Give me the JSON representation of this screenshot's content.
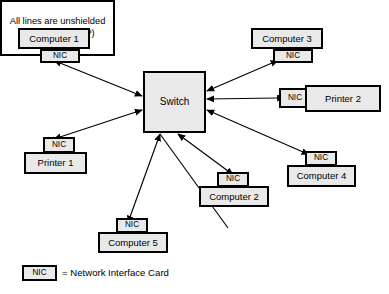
{
  "diagram": {
    "colors": {
      "box_fill": "#e9e9e9",
      "note_fill": "#ffffff",
      "stroke": "#000000",
      "background": "#ffffff"
    },
    "center": {
      "label": "Switch",
      "x": 143,
      "y": 71,
      "w": 63,
      "h": 62
    },
    "nodes": [
      {
        "id": "computer-1",
        "label": "Computer 1",
        "nic_label": "NIC",
        "body": {
          "x": 18,
          "y": 28,
          "w": 72,
          "h": 21
        },
        "nic": {
          "x": 40,
          "y": 49,
          "w": 40,
          "h": 14
        }
      },
      {
        "id": "computer-3",
        "label": "Computer 3",
        "nic_label": "NIC",
        "body": {
          "x": 251,
          "y": 28,
          "w": 72,
          "h": 21
        },
        "nic": {
          "x": 273,
          "y": 49,
          "w": 40,
          "h": 14
        }
      },
      {
        "id": "printer-2",
        "label": "Printer 2",
        "nic_label": "NIC",
        "body": {
          "x": 305,
          "y": 85,
          "w": 76,
          "h": 27
        },
        "nic": {
          "x": 279,
          "y": 88,
          "w": 32,
          "h": 20
        }
      },
      {
        "id": "printer-1",
        "label": "Printer 1",
        "nic_label": "NIC",
        "body": {
          "x": 24,
          "y": 152,
          "w": 63,
          "h": 22
        },
        "nic": {
          "x": 43,
          "y": 137,
          "w": 32,
          "h": 16
        }
      },
      {
        "id": "computer-2",
        "label": "Computer 2",
        "nic_label": "NIC",
        "body": {
          "x": 199,
          "y": 186,
          "w": 70,
          "h": 21
        },
        "nic": {
          "x": 217,
          "y": 172,
          "w": 32,
          "h": 15
        }
      },
      {
        "id": "computer-4",
        "label": "Computer 4",
        "nic_label": "NIC",
        "body": {
          "x": 287,
          "y": 165,
          "w": 69,
          "h": 22
        },
        "nic": {
          "x": 305,
          "y": 151,
          "w": 32,
          "h": 15
        }
      },
      {
        "id": "computer-5",
        "label": "Computer 5",
        "nic_label": "NIC",
        "body": {
          "x": 98,
          "y": 232,
          "w": 70,
          "h": 21
        },
        "nic": {
          "x": 116,
          "y": 218,
          "w": 32,
          "h": 15
        }
      }
    ],
    "note": {
      "text": "All lines are unshielded twisted pair (UTP)",
      "x": 210,
      "y": 228,
      "w": 111,
      "h": 52
    },
    "legend": {
      "nic_label": "NIC",
      "text": "= Network Interface Card",
      "box": {
        "x": 22,
        "y": 265,
        "w": 35,
        "h": 16
      },
      "text_x": 62,
      "text_y": 268
    },
    "links": [
      {
        "id": "link-computer-1",
        "from": [
          60,
          63
        ],
        "to": [
          142,
          96
        ],
        "arrows": "both"
      },
      {
        "id": "link-printer-1",
        "from": [
          60,
          137
        ],
        "to": [
          142,
          110
        ],
        "arrows": "both"
      },
      {
        "id": "link-computer-3",
        "from": [
          272,
          63
        ],
        "to": [
          207,
          91
        ],
        "arrows": "both"
      },
      {
        "id": "link-printer-2",
        "from": [
          278,
          98
        ],
        "to": [
          207,
          99
        ],
        "arrows": "both"
      },
      {
        "id": "link-computer-4",
        "from": [
          303,
          152
        ],
        "to": [
          207,
          110
        ],
        "arrows": "both"
      },
      {
        "id": "link-computer-2",
        "from": [
          228,
          171
        ],
        "to": [
          178,
          134
        ],
        "arrows": "both"
      },
      {
        "id": "link-computer-5",
        "from": [
          130,
          217
        ],
        "to": [
          160,
          134
        ],
        "arrows": "both"
      },
      {
        "id": "link-note",
        "from": [
          228,
          228
        ],
        "to": [
          160,
          134
        ],
        "arrows": "none"
      }
    ]
  }
}
